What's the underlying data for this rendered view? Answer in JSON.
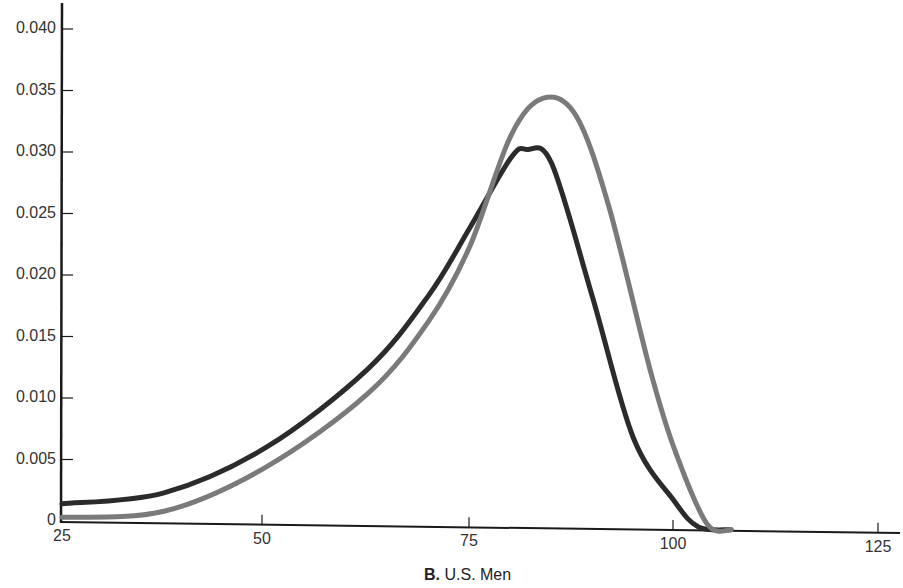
{
  "chart_data": {
    "type": "line",
    "title": "",
    "caption_label": "B.",
    "caption_text": "U.S. Men",
    "xlabel": "",
    "ylabel": "",
    "xlim": [
      25,
      125
    ],
    "ylim": [
      0,
      0.042
    ],
    "x_ticks": [
      25,
      50,
      75,
      100,
      125
    ],
    "x_tick_labels": [
      "25",
      "50",
      "75",
      "100",
      "125"
    ],
    "y_ticks": [
      0,
      0.005,
      0.01,
      0.015,
      0.02,
      0.025,
      0.03,
      0.035,
      0.04
    ],
    "y_tick_labels": [
      "0",
      "0.005",
      "0.010",
      "0.015",
      "0.020",
      "0.025",
      "0.030",
      "0.035",
      "0.040"
    ],
    "grid": false,
    "legend": null,
    "series": [
      {
        "name": "dark curve",
        "color": "#2b2b2b",
        "x": [
          25,
          37.5,
          50,
          62.5,
          70,
          75,
          80,
          82,
          85,
          90,
          95,
          100,
          103,
          107
        ],
        "y": [
          0.0014,
          0.0024,
          0.0062,
          0.0127,
          0.0188,
          0.0243,
          0.03,
          0.0307,
          0.0296,
          0.0188,
          0.0074,
          0.0023,
          0.0002,
          0.0
        ]
      },
      {
        "name": "gray curve",
        "color": "#7a7a7a",
        "x": [
          25,
          37.5,
          50,
          62.5,
          70,
          75,
          80,
          84,
          88,
          92,
          97,
          100,
          104,
          107
        ],
        "y": [
          0.0003,
          0.0009,
          0.0046,
          0.0107,
          0.0167,
          0.0228,
          0.0318,
          0.0349,
          0.0335,
          0.0262,
          0.0131,
          0.0066,
          0.0005,
          0.0
        ]
      }
    ]
  }
}
